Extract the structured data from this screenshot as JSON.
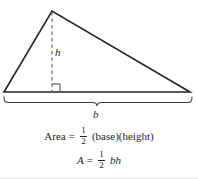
{
  "figure": {
    "labels": {
      "height_label": "h",
      "base_label": "b"
    },
    "formulas": {
      "area_word": {
        "lhs": "Area",
        "equals": "=",
        "fraction_numerator": "1",
        "fraction_denominator": "2",
        "rhs": "(base)(height)"
      },
      "area_symbolic": {
        "lhs": "A",
        "equals": "=",
        "fraction_numerator": "1",
        "fraction_denominator": "2",
        "rhs": "bh"
      }
    },
    "geometry": {
      "apex": "52,11",
      "left_vertex": "4,92",
      "right_vertex": "190,92",
      "height_foot": "52,92",
      "brace_left": "4,97",
      "brace_right": "192,97"
    },
    "colors": {
      "ink": "#1f1f1f",
      "background": "#ffffff",
      "dashed": "#4a4a4a"
    }
  }
}
